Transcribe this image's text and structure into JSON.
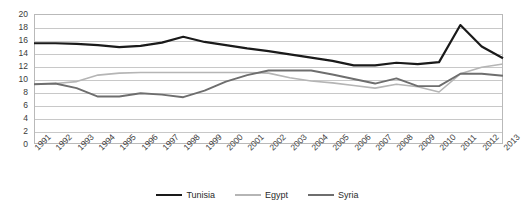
{
  "chart_data": {
    "type": "line",
    "title": "",
    "subtitle": "",
    "xlabel": "",
    "ylabel": "",
    "categories": [
      "1991",
      "1992",
      "1993",
      "1994",
      "1995",
      "1996",
      "1997",
      "1998",
      "1999",
      "2000",
      "2001",
      "2002",
      "2003",
      "2004",
      "2005",
      "2006",
      "2007",
      "2008",
      "2009",
      "2010",
      "2011",
      "2012",
      "2013"
    ],
    "series": [
      {
        "name": "Tunisia",
        "color": "#1a1a1a",
        "stroke_width": 2.2,
        "values": [
          15.5,
          15.5,
          15.4,
          15.2,
          14.9,
          15.1,
          15.6,
          16.5,
          15.7,
          15.2,
          14.7,
          14.3,
          13.8,
          13.3,
          12.8,
          12.1,
          12.1,
          12.5,
          12.3,
          12.6,
          18.3,
          15.0,
          13.2
        ]
      },
      {
        "name": "Egypt",
        "color": "#b5b5b5",
        "stroke_width": 1.6,
        "values": [
          9.2,
          9.3,
          9.6,
          10.6,
          10.9,
          11.0,
          11.0,
          11.0,
          11.0,
          11.0,
          11.0,
          10.9,
          10.2,
          9.7,
          9.4,
          9.0,
          8.6,
          9.2,
          8.8,
          8.0,
          10.8,
          11.8,
          12.3
        ]
      },
      {
        "name": "Syria",
        "color": "#6e6e6e",
        "stroke_width": 1.9,
        "values": [
          9.2,
          9.3,
          8.6,
          7.3,
          7.3,
          7.8,
          7.6,
          7.2,
          8.2,
          9.6,
          10.6,
          11.3,
          11.3,
          11.3,
          10.7,
          10.0,
          9.3,
          10.1,
          8.9,
          8.9,
          10.8,
          10.8,
          10.5
        ]
      }
    ],
    "ylim": [
      0,
      20
    ],
    "ytick_step": 2,
    "yticks": [
      "20",
      "18",
      "16",
      "14",
      "12",
      "10",
      "8",
      "6",
      "4",
      "2",
      "0"
    ],
    "grid": true,
    "grid_color": "#c8c8c8",
    "legend": {
      "position": "bottom-center",
      "entries": [
        "Tunisia",
        "Egypt",
        "Syria"
      ]
    },
    "xtick_rotation": -45,
    "plot_border_color": "#b9b9b9",
    "background": "#ffffff"
  }
}
